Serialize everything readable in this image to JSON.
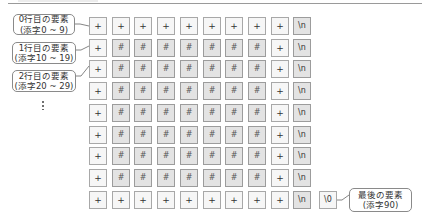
{
  "diagram": {
    "symbols": {
      "border": "+",
      "fill": "#",
      "newline": "\\n",
      "null_terminator": "\\0"
    },
    "rows": [
      [
        "+",
        "+",
        "+",
        "+",
        "+",
        "+",
        "+",
        "+",
        "+",
        "\\n"
      ],
      [
        "+",
        "#",
        "#",
        "#",
        "#",
        "#",
        "#",
        "#",
        "+",
        "\\n"
      ],
      [
        "+",
        "#",
        "#",
        "#",
        "#",
        "#",
        "#",
        "#",
        "+",
        "\\n"
      ],
      [
        "+",
        "#",
        "#",
        "#",
        "#",
        "#",
        "#",
        "#",
        "+",
        "\\n"
      ],
      [
        "+",
        "#",
        "#",
        "#",
        "#",
        "#",
        "#",
        "#",
        "+",
        "\\n"
      ],
      [
        "+",
        "#",
        "#",
        "#",
        "#",
        "#",
        "#",
        "#",
        "+",
        "\\n"
      ],
      [
        "+",
        "#",
        "#",
        "#",
        "#",
        "#",
        "#",
        "#",
        "+",
        "\\n"
      ],
      [
        "+",
        "#",
        "#",
        "#",
        "#",
        "#",
        "#",
        "#",
        "+",
        "\\n"
      ],
      [
        "+",
        "+",
        "+",
        "+",
        "+",
        "+",
        "+",
        "+",
        "+",
        "\\n",
        "\\0"
      ]
    ],
    "callouts": [
      {
        "line1": "0行目の要素",
        "line2": "(添字0 ~ 9)"
      },
      {
        "line1": "1行目の要素",
        "line2": "(添字10 ~ 19)"
      },
      {
        "line1": "2行目の要素",
        "line2": "(添字20 ~ 29)"
      },
      {
        "line1": "最後の要素",
        "line2": "(添字90)"
      }
    ],
    "ellipsis": "⋮"
  }
}
